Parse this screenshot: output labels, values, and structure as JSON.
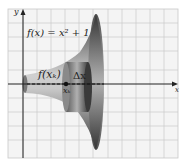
{
  "figure": {
    "function_label": "f(x) = x² + 1",
    "radius_label": "f(xₖ)",
    "width_label": "Δx",
    "point_label": "xₖ",
    "x_axis_label": "x",
    "y_axis_label": "y"
  },
  "colors": {
    "grid": "#c8c8c8",
    "grid_bg": "#f4f4f4",
    "solid_dark": "#4a4a4a",
    "solid_light": "#d8d8d8",
    "axis": "#222222"
  }
}
